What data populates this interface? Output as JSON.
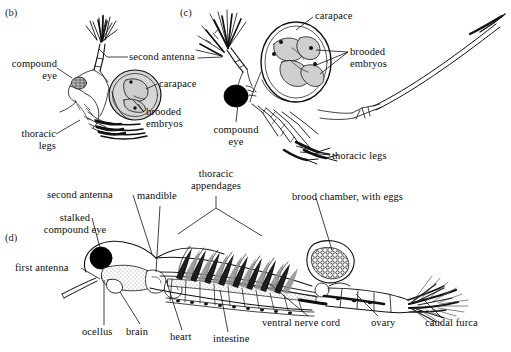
{
  "figure": {
    "type": "scientific-illustration",
    "background_color": "#ffffff",
    "ink_color": "#111111",
    "fill_light": "#d8d8d8",
    "fill_dark": "#000000"
  },
  "panels": [
    {
      "id": "b",
      "tag": "(b)",
      "labels": [
        {
          "key": "second_antenna",
          "text": "second antenna"
        },
        {
          "key": "compound_eye",
          "text": "compound\neye"
        },
        {
          "key": "carapace",
          "text": "carapace"
        },
        {
          "key": "brooded_embryos",
          "text": "brooded\nembryos"
        },
        {
          "key": "thoracic_legs",
          "text": "thoracic\nlegs"
        }
      ]
    },
    {
      "id": "c",
      "tag": "(c)",
      "labels": [
        {
          "key": "carapace",
          "text": "carapace"
        },
        {
          "key": "brooded_embryos",
          "text": "brooded\nembryos"
        },
        {
          "key": "compound_eye",
          "text": "compound\neye"
        },
        {
          "key": "thoracic_legs",
          "text": "thoracic legs"
        }
      ]
    },
    {
      "id": "d",
      "tag": "(d)",
      "labels": [
        {
          "key": "second_antenna",
          "text": "second antenna"
        },
        {
          "key": "stalked_compound_eye",
          "text": "stalked\ncompound eye"
        },
        {
          "key": "first_antenna",
          "text": "first antenna"
        },
        {
          "key": "mandible",
          "text": "mandible"
        },
        {
          "key": "thoracic_appendages",
          "text": "thoracic\nappendages"
        },
        {
          "key": "brood_chamber",
          "text": "brood chamber, with eggs"
        },
        {
          "key": "ocellus",
          "text": "ocellus"
        },
        {
          "key": "brain",
          "text": "brain"
        },
        {
          "key": "heart",
          "text": "heart"
        },
        {
          "key": "intestine",
          "text": "intestine"
        },
        {
          "key": "ventral_nerve_cord",
          "text": "ventral nerve cord"
        },
        {
          "key": "ovary",
          "text": "ovary"
        },
        {
          "key": "caudal_furca",
          "text": "caudal furca"
        }
      ]
    }
  ]
}
